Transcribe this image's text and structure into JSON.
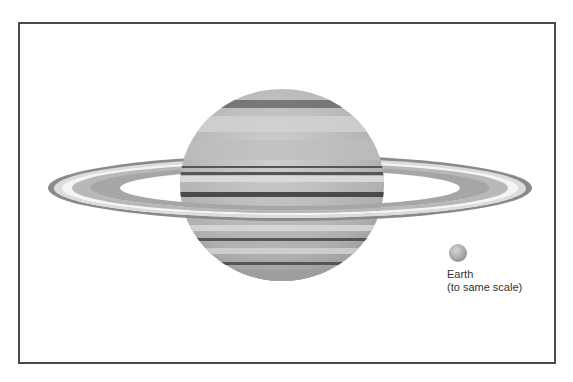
{
  "figure": {
    "comparison": {
      "label_line1": "Earth",
      "label_line2": "(to same scale)"
    },
    "colors": {
      "frame": "#4a4a4a",
      "planet_base": "#b5b5b5",
      "band_dark": "#5c5c5c",
      "band_light": "#d6d6d6",
      "ring_outer": "#8a8a8a",
      "ring_light": "#e8e8e8",
      "earth": "#a8a8a8"
    }
  }
}
